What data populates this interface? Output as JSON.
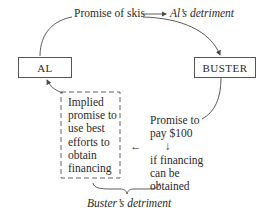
{
  "diagram": {
    "nodes": {
      "al": {
        "label": "AL"
      },
      "buster": {
        "label": "BUSTER"
      }
    },
    "top": {
      "promise_label": "Promise of skis",
      "detriment_label": "Al’s detriment"
    },
    "right": {
      "lines": [
        "Promise to",
        "pay $100"
      ],
      "down_arrow": "↓",
      "condition_lines": [
        "if financing",
        "can be",
        "obtained"
      ],
      "left_arrow": "←"
    },
    "dashed_box": {
      "lines": [
        "Implied",
        "promise to",
        "use best",
        "efforts to",
        "obtain",
        "financing"
      ]
    },
    "bottom": {
      "detriment_label": "Buster’s detriment"
    },
    "colors": {
      "line": "#4a4a4a",
      "text": "#2a2a2a",
      "background": "#ffffff"
    }
  }
}
